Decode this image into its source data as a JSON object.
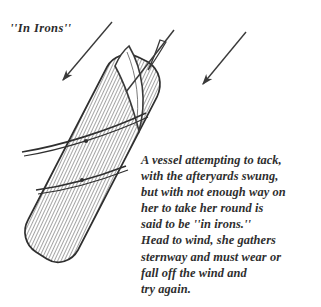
{
  "figure": {
    "title": "''In Irons''",
    "ink_color": "#333333",
    "background_color": "#ffffff",
    "hatch_color": "#555555"
  },
  "caption": {
    "lines": [
      "A vessel attempting to tack,",
      "with the afteryards swung,",
      "but with not enough way on",
      "her to take her round is",
      "said to be ''in irons.''",
      "Head to wind, she gathers",
      "sternway and must wear or",
      "fall off the wind and",
      "try again."
    ]
  },
  "diagram": {
    "hull_label": "hull-hatched",
    "sail_label": "curved-sail",
    "arrows": [
      {
        "name": "wind-arrow-left",
        "direction": "down-left"
      },
      {
        "name": "wind-arrow-right",
        "direction": "down-left"
      }
    ],
    "yards": [
      {
        "name": "upper-yard"
      },
      {
        "name": "lower-yard"
      }
    ]
  }
}
